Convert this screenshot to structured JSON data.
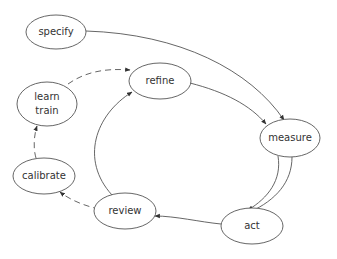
{
  "diagram": {
    "type": "directed-graph",
    "nodes": [
      {
        "id": "specify",
        "label": "specify",
        "cx": 56,
        "cy": 32,
        "rx": 30,
        "ry": 17
      },
      {
        "id": "refine",
        "label": "refine",
        "cx": 160,
        "cy": 81,
        "rx": 31,
        "ry": 18
      },
      {
        "id": "learn_train",
        "label_line1": "learn",
        "label_line2": "train",
        "cx": 47,
        "cy": 104,
        "rx": 30,
        "ry": 22
      },
      {
        "id": "measure",
        "label": "measure",
        "cx": 290,
        "cy": 138,
        "rx": 30,
        "ry": 19
      },
      {
        "id": "calibrate",
        "label": "calibrate",
        "cx": 44,
        "cy": 176,
        "rx": 31,
        "ry": 18
      },
      {
        "id": "review",
        "label": "review",
        "cx": 125,
        "cy": 211,
        "rx": 31,
        "ry": 18
      },
      {
        "id": "act",
        "label": "act",
        "cx": 252,
        "cy": 226,
        "rx": 31,
        "ry": 18
      }
    ],
    "edges": [
      {
        "from": "specify",
        "to": "measure",
        "style": "solid"
      },
      {
        "from": "refine",
        "to": "measure",
        "style": "solid"
      },
      {
        "from": "measure",
        "to": "act",
        "style": "solid"
      },
      {
        "from": "measure",
        "to": "act",
        "style": "solid"
      },
      {
        "from": "act",
        "to": "review",
        "style": "solid"
      },
      {
        "from": "review",
        "to": "refine",
        "style": "solid"
      },
      {
        "from": "review",
        "to": "calibrate",
        "style": "dashed"
      },
      {
        "from": "calibrate",
        "to": "learn_train",
        "style": "dashed"
      },
      {
        "from": "learn_train",
        "to": "refine",
        "style": "dashed"
      }
    ],
    "colors": {
      "stroke": "#555555",
      "text": "#333333",
      "background": "#ffffff"
    }
  }
}
